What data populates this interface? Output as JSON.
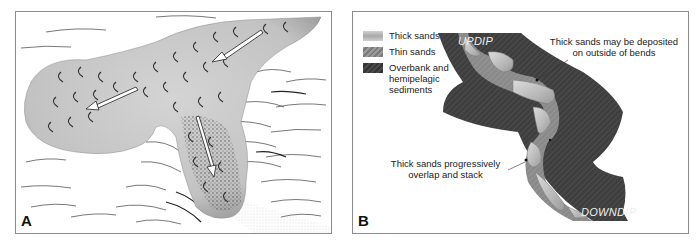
{
  "figure": {
    "panels": [
      {
        "id": "A",
        "label": "A",
        "description": "Submarine fan lobe illustration with scalloped sand surface, flow arrows and dotted channel fill"
      },
      {
        "id": "B",
        "label": "B",
        "legend": [
          {
            "label": "Thick sands",
            "swatch": "light-gray-gradient"
          },
          {
            "label": "Thin sands",
            "swatch": "gray-hatched"
          },
          {
            "label": "Overbank and hemipelagic sediments",
            "swatch": "dark-gray-hatched"
          }
        ],
        "annotations": {
          "top": "Thick sands may be deposited on outside of bends",
          "bottom": "Thick sands progressively overlap and stack"
        },
        "direction_labels": {
          "updip": "UPDIP",
          "downdip": "DOWNDIP"
        }
      }
    ],
    "colors": {
      "frame": "#8c8c8c",
      "overbank": "#3c3c3c",
      "thin_sand": "#8a8a8a",
      "thick_sand": "#c4c4c4",
      "fan_fill": "#c8c8c8"
    }
  }
}
